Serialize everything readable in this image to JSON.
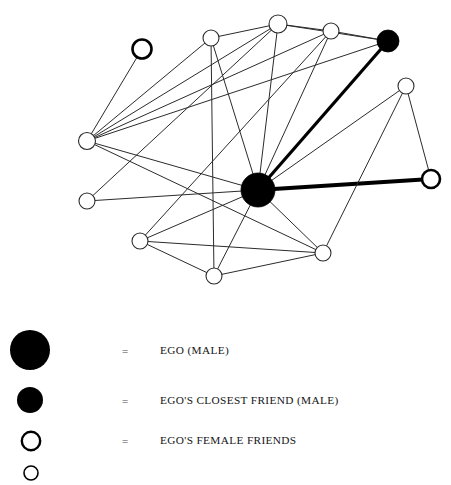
{
  "figure": {
    "background_color": "#ffffff",
    "line_color": "#2b2b2b",
    "node_fill_open": "#ffffff",
    "node_fill_filled": "#000000"
  },
  "chart_data": {
    "type": "diagram",
    "subtype": "node-link-network",
    "title": "",
    "xlabel": "",
    "ylabel": "",
    "layout": {
      "width": 451,
      "height": 300,
      "grid": false,
      "legend_position": "below"
    },
    "node_types": {
      "ego": {
        "fill": "#000000",
        "stroke": "#000000",
        "radius": 17
      },
      "closest_friend": {
        "fill": "#000000",
        "stroke": "#000000",
        "radius": 11
      },
      "female_friend": {
        "fill": "#ffffff",
        "stroke": "#2b2b2b",
        "radius": 8
      },
      "female_friend_bold": {
        "fill": "#ffffff",
        "stroke": "#000000",
        "radius": 9
      }
    },
    "nodes": [
      {
        "id": "ego",
        "label": "EGO",
        "type": "ego",
        "x": 258,
        "y": 190,
        "r": 17
      },
      {
        "id": "cf",
        "label": "CF",
        "type": "closest_friend",
        "x": 388,
        "y": 41,
        "r": 11
      },
      {
        "id": "f1",
        "label": "F1",
        "type": "female_friend_bold",
        "x": 142,
        "y": 49,
        "r": 9.5
      },
      {
        "id": "f2",
        "label": "F2",
        "type": "female_friend",
        "x": 211,
        "y": 38,
        "r": 8
      },
      {
        "id": "f3",
        "label": "F3",
        "type": "female_friend",
        "x": 278,
        "y": 24,
        "r": 9
      },
      {
        "id": "f4",
        "label": "F4",
        "type": "female_friend",
        "x": 331,
        "y": 31,
        "r": 8
      },
      {
        "id": "f5",
        "label": "F5",
        "type": "female_friend",
        "x": 406,
        "y": 86,
        "r": 8
      },
      {
        "id": "f6",
        "label": "F6",
        "type": "female_friend",
        "x": 87,
        "y": 141,
        "r": 8.5
      },
      {
        "id": "f7",
        "label": "F7",
        "type": "female_friend",
        "x": 87,
        "y": 201,
        "r": 8
      },
      {
        "id": "f8",
        "label": "F8",
        "type": "female_friend_bold",
        "x": 431,
        "y": 179,
        "r": 9
      },
      {
        "id": "f9",
        "label": "F9",
        "type": "female_friend",
        "x": 140,
        "y": 241,
        "r": 8
      },
      {
        "id": "f10",
        "label": "F10",
        "type": "female_friend",
        "x": 214,
        "y": 276,
        "r": 8
      },
      {
        "id": "f11",
        "label": "F11",
        "type": "female_friend",
        "x": 323,
        "y": 253,
        "r": 8
      }
    ],
    "edges": [
      {
        "source": "ego",
        "target": "cf",
        "weight": "thick",
        "width": 3.2
      },
      {
        "source": "ego",
        "target": "f8",
        "weight": "thick",
        "width": 4.2
      },
      {
        "source": "ego",
        "target": "f2",
        "weight": "thin",
        "width": 1
      },
      {
        "source": "ego",
        "target": "f3",
        "weight": "thin",
        "width": 1
      },
      {
        "source": "ego",
        "target": "f4",
        "weight": "thin",
        "width": 1
      },
      {
        "source": "ego",
        "target": "f5",
        "weight": "thin",
        "width": 1
      },
      {
        "source": "ego",
        "target": "f6",
        "weight": "thin",
        "width": 1
      },
      {
        "source": "ego",
        "target": "f7",
        "weight": "thin",
        "width": 1
      },
      {
        "source": "ego",
        "target": "f9",
        "weight": "thin",
        "width": 1
      },
      {
        "source": "ego",
        "target": "f10",
        "weight": "thin",
        "width": 1
      },
      {
        "source": "ego",
        "target": "f11",
        "weight": "thin",
        "width": 1
      },
      {
        "source": "f1",
        "target": "f6",
        "weight": "thin",
        "width": 1
      },
      {
        "source": "f6",
        "target": "f2",
        "weight": "thin",
        "width": 1
      },
      {
        "source": "f6",
        "target": "f3",
        "weight": "thin",
        "width": 1
      },
      {
        "source": "f6",
        "target": "f4",
        "weight": "thin",
        "width": 1
      },
      {
        "source": "f6",
        "target": "cf",
        "weight": "thin",
        "width": 1
      },
      {
        "source": "f6",
        "target": "f11",
        "weight": "thin",
        "width": 1
      },
      {
        "source": "f7",
        "target": "f3",
        "weight": "thin",
        "width": 1
      },
      {
        "source": "f2",
        "target": "f3",
        "weight": "thin",
        "width": 1
      },
      {
        "source": "f2",
        "target": "f10",
        "weight": "thin",
        "width": 1
      },
      {
        "source": "f3",
        "target": "f4",
        "weight": "thin",
        "width": 1
      },
      {
        "source": "f3",
        "target": "cf",
        "weight": "thin",
        "width": 1
      },
      {
        "source": "f4",
        "target": "cf",
        "weight": "thin",
        "width": 1
      },
      {
        "source": "f4",
        "target": "f9",
        "weight": "thin",
        "width": 1
      },
      {
        "source": "f5",
        "target": "f8",
        "weight": "thin",
        "width": 1
      },
      {
        "source": "f5",
        "target": "f11",
        "weight": "thin",
        "width": 1
      },
      {
        "source": "f9",
        "target": "f10",
        "weight": "thin",
        "width": 1
      },
      {
        "source": "f9",
        "target": "f11",
        "weight": "thin",
        "width": 1
      },
      {
        "source": "f10",
        "target": "f11",
        "weight": "thin",
        "width": 1
      }
    ]
  },
  "legend": {
    "equals_sign": "=",
    "items": [
      {
        "marker": "large-filled-circle",
        "radius": 20,
        "fill": "#000000",
        "stroke": "#000000",
        "stroke_width": 0,
        "equals": "=",
        "label": "EGO (MALE)"
      },
      {
        "marker": "medium-filled-circle",
        "radius": 13,
        "fill": "#000000",
        "stroke": "#000000",
        "stroke_width": 0,
        "equals": "=",
        "label": "EGO'S CLOSEST FRIEND (MALE)"
      },
      {
        "marker": "open-circle",
        "radius": 9.5,
        "fill": "#ffffff",
        "stroke": "#000000",
        "stroke_width": 2.4,
        "equals": "=",
        "label": "EGO'S FEMALE FRIENDS"
      },
      {
        "marker": "small-open-circle-cropped",
        "radius": 7,
        "fill": "#ffffff",
        "stroke": "#000000",
        "stroke_width": 1.6,
        "equals": "",
        "label": ""
      }
    ]
  }
}
